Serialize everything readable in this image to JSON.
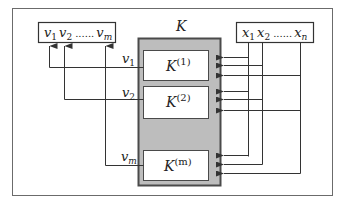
{
  "diagram": {
    "system_label": "K",
    "output_box": {
      "items": [
        "v",
        "v",
        "v"
      ],
      "subscripts": [
        "1",
        "2",
        "m"
      ],
      "ellipsis": "......"
    },
    "input_box": {
      "items": [
        "x",
        "x",
        "x"
      ],
      "subscripts": [
        "1",
        "2",
        "n"
      ],
      "ellipsis": "......"
    },
    "subsystems": [
      {
        "base": "K",
        "superscript": "(1)",
        "output_label": "v",
        "output_sub": "1"
      },
      {
        "base": "K",
        "superscript": "(2)",
        "output_label": "v",
        "output_sub": "2"
      },
      {
        "base": "K",
        "superscript": "(m)",
        "output_label": "v",
        "output_sub": "m"
      }
    ],
    "colors": {
      "frame": "#6b6b6b",
      "line": "#3a3a3a",
      "system_fill": "#bdbdbd",
      "system_border": "#4a4a4a",
      "box_fill": "#ffffff"
    }
  }
}
